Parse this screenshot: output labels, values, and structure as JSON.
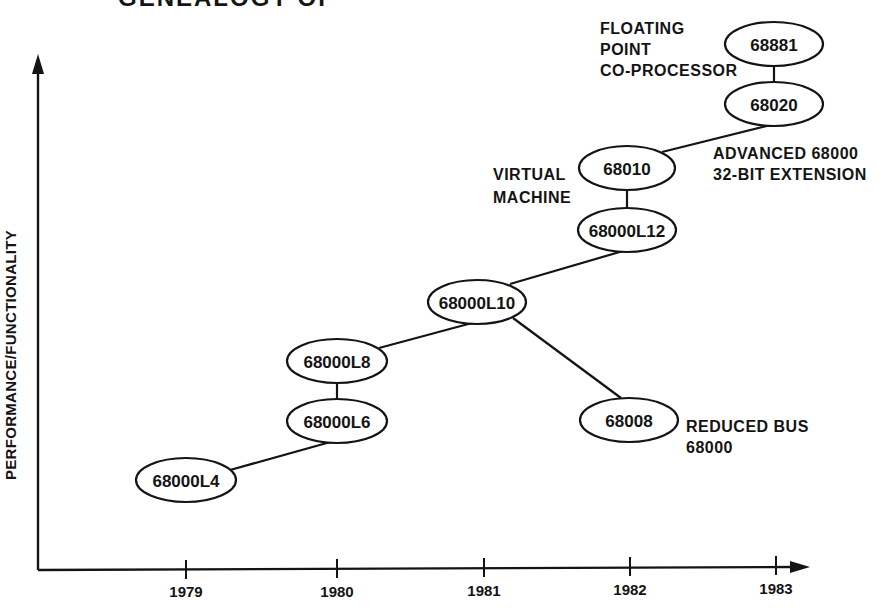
{
  "title": {
    "text": "GENEALOGY OF",
    "note": "partially cut off at top edge"
  },
  "axes": {
    "y_label": "PERFORMANCE/FUNCTIONALITY",
    "x_ticks": [
      "1979",
      "1980",
      "1981",
      "1982",
      "1983"
    ]
  },
  "nodes": {
    "n68000L4": "68000L4",
    "n68000L6": "68000L6",
    "n68000L8": "68000L8",
    "n68000L10": "68000L10",
    "n68008": "68008",
    "n68000L12": "68000L12",
    "n68010": "68010",
    "n68020": "68020",
    "n68881": "68881"
  },
  "annotations": {
    "floating_point": [
      "FLOATING",
      "POINT",
      "CO-PROCESSOR"
    ],
    "advanced": [
      "ADVANCED 68000",
      "32-BIT EXTENSION"
    ],
    "virtual_machine": [
      "VIRTUAL",
      "MACHINE"
    ],
    "reduced_bus": [
      "REDUCED BUS",
      "68000"
    ]
  },
  "edges": [
    [
      "68000L4",
      "68000L6"
    ],
    [
      "68000L6",
      "68000L8"
    ],
    [
      "68000L8",
      "68000L10"
    ],
    [
      "68000L10",
      "68008"
    ],
    [
      "68000L10",
      "68000L12"
    ],
    [
      "68000L12",
      "68010"
    ],
    [
      "68010",
      "68020"
    ],
    [
      "68020",
      "68881"
    ]
  ],
  "colors": {
    "ink": "#141414",
    "background": "#ffffff"
  }
}
